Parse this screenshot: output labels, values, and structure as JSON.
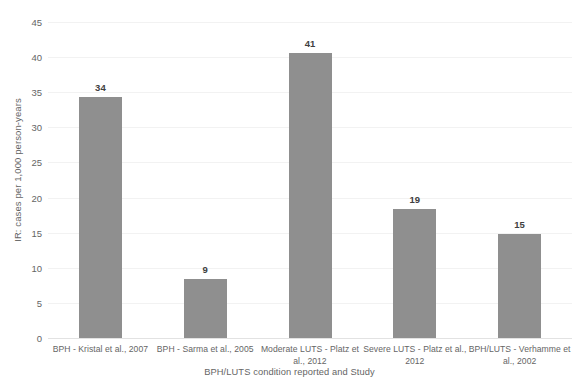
{
  "chart_data": {
    "type": "bar",
    "title": "",
    "xlabel": "BPH/LUTS condition reported and Study",
    "ylabel": "IR: cases per 1,000 person-years",
    "categories": [
      "BPH - Kristal et al., 2007",
      "BPH - Sarma et al., 2005",
      "Moderate LUTS - Platz et al., 2012",
      "Severe LUTS - Platz et al., 2012",
      "BPH/LUTS - Verhamme et al., 2002"
    ],
    "values": [
      34,
      9,
      41,
      19,
      15
    ],
    "bar_heights": [
      34.3,
      8.4,
      40.6,
      18.4,
      14.8
    ],
    "data_labels": [
      "34",
      "9",
      "41",
      "19",
      "15"
    ],
    "ylim": [
      0,
      45
    ],
    "ytick_labels": [
      "0",
      "5",
      "10",
      "15",
      "20",
      "25",
      "30",
      "35",
      "40",
      "45"
    ],
    "ytick_values": [
      0,
      5,
      10,
      15,
      20,
      25,
      30,
      35,
      40,
      45
    ],
    "grid": true,
    "legend": "none",
    "bar_color": "#8f8f8f",
    "gridline_color": "#f2f2f2",
    "text_color": "#656565",
    "background_color": "#ffffff"
  }
}
